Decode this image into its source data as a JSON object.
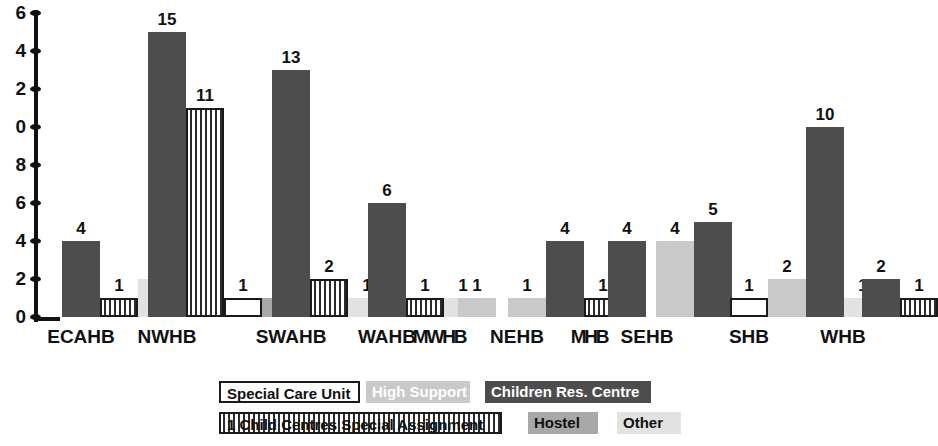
{
  "chart_data": {
    "type": "bar",
    "title": "",
    "xlabel": "",
    "ylabel": "",
    "ylim": [
      0,
      16
    ],
    "yticks": [
      0,
      2,
      4,
      6,
      8,
      10,
      12,
      14,
      16
    ],
    "ytick_labels": [
      "0",
      "2",
      "4",
      "6",
      "8",
      "0",
      "2",
      "4",
      "6"
    ],
    "grid": false,
    "legend_position": "bottom",
    "categories": [
      "ECAHB",
      "NWHB",
      "SWAHB",
      "WAHB",
      "MWHB",
      "NEHB",
      "MHB",
      "SEHB",
      "SHB",
      "WHB"
    ],
    "series": [
      {
        "name": "Special Care Unit",
        "key": "scu",
        "fill": "#ffffff",
        "values": [
          null,
          1,
          1,
          null,
          null,
          null,
          null,
          null,
          1,
          null
        ]
      },
      {
        "name": "High Support",
        "key": "hs",
        "fill": "#c9c9c9",
        "values": [
          null,
          null,
          null,
          null,
          1,
          1,
          null,
          4,
          2,
          null
        ]
      },
      {
        "name": "Children Res. Centre",
        "key": "crc",
        "fill": "#4d4d4d",
        "values": [
          4,
          15,
          13,
          6,
          null,
          4,
          4,
          5,
          10,
          2
        ]
      },
      {
        "name": "1 Child Centres Special Assignment",
        "key": "ccsa",
        "fill": "#ffffff",
        "values": [
          1,
          11,
          2,
          1,
          null,
          1,
          null,
          null,
          null,
          1
        ]
      },
      {
        "name": "Hostel",
        "key": "host",
        "fill": "#a8a8a8",
        "values": [
          null,
          1,
          null,
          null,
          null,
          null,
          null,
          null,
          null,
          null
        ]
      },
      {
        "name": "Other",
        "key": "oth",
        "fill": "#e2e2e2",
        "values": [
          2,
          null,
          1,
          1,
          null,
          null,
          null,
          null,
          1,
          null
        ]
      }
    ],
    "bars": [
      {
        "group": "ECAHB",
        "series": "Children Res. Centre",
        "key": "crc",
        "value": 4,
        "label": "4",
        "x": 24,
        "w": 38
      },
      {
        "group": "ECAHB",
        "series": "1 Child Centres Special Assignment",
        "key": "ccsa",
        "value": 1,
        "label": "1",
        "x": 62,
        "w": 38
      },
      {
        "group": "ECAHB",
        "series": "Other",
        "key": "oth",
        "value": 2,
        "label": "2",
        "x": 100,
        "w": 38
      },
      {
        "group": "NWHB",
        "series": "Children Res. Centre",
        "key": "crc",
        "value": 15,
        "label": "15",
        "x": 110,
        "w": 38
      },
      {
        "group": "NWHB",
        "series": "1 Child Centres Special Assignment",
        "key": "ccsa",
        "value": 11,
        "label": "11",
        "x": 148,
        "w": 38
      },
      {
        "group": "NWHB",
        "series": "Special Care Unit",
        "key": "scu",
        "value": 1,
        "label": "1",
        "x": 186,
        "w": 38
      },
      {
        "group": "NWHB",
        "series": "Hostel",
        "key": "host",
        "value": 1,
        "label": "1",
        "x": 224,
        "w": 38
      },
      {
        "group": "SWAHB",
        "series": "Children Res. Centre",
        "key": "crc",
        "value": 13,
        "label": "13",
        "x": 234,
        "w": 38
      },
      {
        "group": "SWAHB",
        "series": "1 Child Centres Special Assignment",
        "key": "ccsa",
        "value": 2,
        "label": "2",
        "x": 272,
        "w": 38
      },
      {
        "group": "SWAHB",
        "series": "Other",
        "key": "oth",
        "value": 1,
        "label": "1",
        "x": 310,
        "w": 38
      },
      {
        "group": "WAHB",
        "series": "Children Res. Centre",
        "key": "crc",
        "value": 6,
        "label": "6",
        "x": 330,
        "w": 38
      },
      {
        "group": "WAHB",
        "series": "1 Child Centres Special Assignment",
        "key": "ccsa",
        "value": 1,
        "label": "1",
        "x": 368,
        "w": 38
      },
      {
        "group": "WAHB",
        "series": "Other",
        "key": "oth",
        "value": 1,
        "label": "1",
        "x": 406,
        "w": 38
      },
      {
        "group": "MWHB",
        "series": "High Support",
        "key": "hs",
        "value": 1,
        "label": "1",
        "x": 420,
        "w": 38
      },
      {
        "group": "NEHB",
        "series": "High Support",
        "key": "hs",
        "value": 1,
        "label": "1",
        "x": 470,
        "w": 38
      },
      {
        "group": "NEHB",
        "series": "Children Res. Centre",
        "key": "crc",
        "value": 4,
        "label": "4",
        "x": 508,
        "w": 38
      },
      {
        "group": "NEHB",
        "series": "1 Child Centres Special Assignment",
        "key": "ccsa",
        "value": 1,
        "label": "1",
        "x": 546,
        "w": 38
      },
      {
        "group": "MHB",
        "series": "Children Res. Centre",
        "key": "crc",
        "value": 4,
        "label": "4",
        "x": 570,
        "w": 38
      },
      {
        "group": "SEHB",
        "series": "High Support",
        "key": "hs",
        "value": 4,
        "label": "4",
        "x": 618,
        "w": 38
      },
      {
        "group": "SEHB",
        "series": "Children Res. Centre",
        "key": "crc",
        "value": 5,
        "label": "5",
        "x": 656,
        "w": 38
      },
      {
        "group": "SHB",
        "series": "Special Care Unit",
        "key": "scu",
        "value": 1,
        "label": "1",
        "x": 692,
        "w": 38
      },
      {
        "group": "SHB",
        "series": "High Support",
        "key": "hs",
        "value": 2,
        "label": "2",
        "x": 730,
        "w": 38
      },
      {
        "group": "SHB",
        "series": "Children Res. Centre",
        "key": "crc",
        "value": 10,
        "label": "10",
        "x": 768,
        "w": 38
      },
      {
        "group": "SHB",
        "series": "Other",
        "key": "oth",
        "value": 1,
        "label": "1",
        "x": 806,
        "w": 38
      },
      {
        "group": "WHB",
        "series": "Children Res. Centre",
        "key": "crc",
        "value": 2,
        "label": "2",
        "x": 824,
        "w": 38
      },
      {
        "group": "WHB",
        "series": "1 Child Centres Special Assignment",
        "key": "ccsa",
        "value": 1,
        "label": "1",
        "x": 862,
        "w": 38
      }
    ],
    "group_label_positions": [
      {
        "label": "ECAHB",
        "x": 81,
        "squish": false
      },
      {
        "label": "NWHB",
        "x": 167,
        "squish": false
      },
      {
        "label": "SWAHB",
        "x": 291,
        "squish": false
      },
      {
        "label": "WAHB",
        "x": 387,
        "squish": false
      },
      {
        "label": "MWHB",
        "x": 439,
        "squish": true
      },
      {
        "label": "NEHB",
        "x": 517,
        "squish": false
      },
      {
        "label": "MHB",
        "x": 589,
        "squish": true
      },
      {
        "label": "SEHB",
        "x": 647,
        "squish": false
      },
      {
        "label": "SHB",
        "x": 749,
        "squish": false
      },
      {
        "label": "WHB",
        "x": 843,
        "squish": false
      }
    ],
    "legend_items": [
      {
        "name": "Special Care Unit",
        "key": "scu",
        "x": 219,
        "y": 0,
        "w": 141
      },
      {
        "name": "High Support",
        "key": "hs",
        "x": 366,
        "y": 0,
        "w": 104
      },
      {
        "name": "Children Res. Centre",
        "key": "crc",
        "x": 485,
        "y": 0,
        "w": 166
      },
      {
        "name": "1 Child Centres Special Assignment",
        "key": "ccsa",
        "x": 219,
        "y": 31,
        "w": 283
      },
      {
        "name": "Hostel",
        "key": "host",
        "x": 528,
        "y": 31,
        "w": 70
      },
      {
        "name": "Other",
        "key": "oth",
        "x": 617,
        "y": 31,
        "w": 64
      }
    ]
  }
}
